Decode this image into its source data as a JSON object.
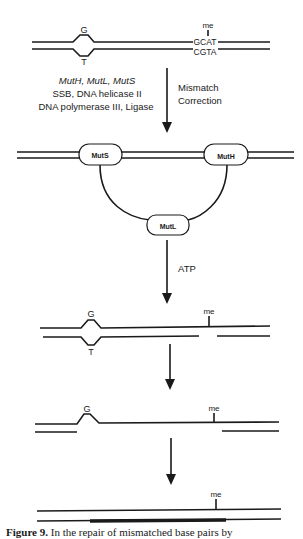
{
  "diagram": {
    "step1": {
      "mismatch_top_base": "G",
      "mismatch_bottom_base": "T",
      "methyl_label": "me",
      "site_top": "GCAT",
      "site_bottom": "CGTA"
    },
    "enzymes": {
      "line1": "MutH, MutL, MutS",
      "line2": "SSB, DNA helicase II",
      "line3": "DNA polymerase III, Ligase"
    },
    "arrow1_label_line1": "Mismatch",
    "arrow1_label_line2": "Correction",
    "step2": {
      "protein_left": "MutS",
      "protein_right": "MutH",
      "protein_bottom": "MutL"
    },
    "arrow2_label": "ATP",
    "step3": {
      "top_base": "G",
      "bottom_base": "T",
      "methyl_label": "me"
    },
    "step4": {
      "top_base": "G",
      "methyl_label": "me"
    },
    "step5": {
      "methyl_label": "me"
    }
  },
  "caption": {
    "label": "Figure 9.",
    "text": "In the repair of mismatched base pairs by"
  }
}
